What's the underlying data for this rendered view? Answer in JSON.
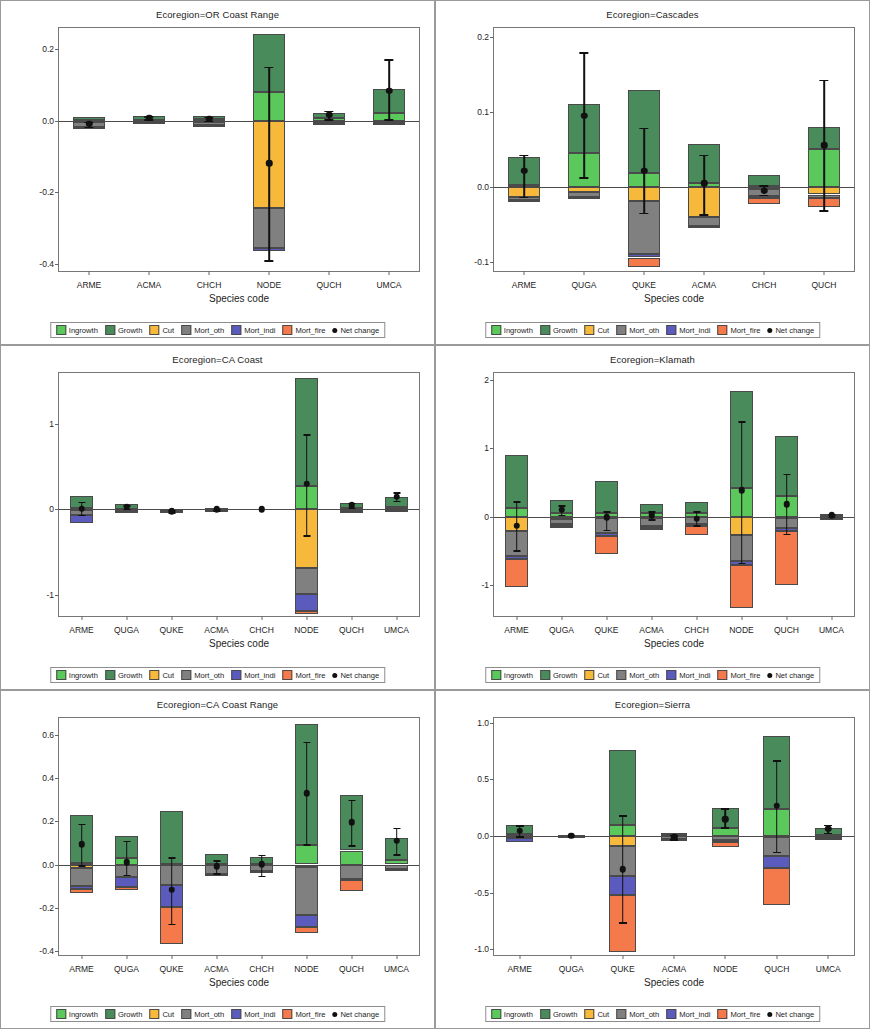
{
  "figure": {
    "xlabel": "Species code",
    "ylabel_prefix": "Basal area change (100,000 m",
    "ylabel_sup1": "2",
    "ylabel_mid": "yr",
    "ylabel_sup2": "-1",
    "ylabel_suffix": ")"
  },
  "legend": {
    "items": [
      {
        "label": "Ingrowth",
        "color": "#5ac85a"
      },
      {
        "label": "Growth",
        "color": "#4a8b5c"
      },
      {
        "label": "Cut",
        "color": "#f6b93b"
      },
      {
        "label": "Mort_oth",
        "color": "#808080"
      },
      {
        "label": "Mort_indi",
        "color": "#5b5bbd"
      },
      {
        "label": "Mort_fire",
        "color": "#f4794b"
      },
      {
        "label": "Net change",
        "color": "#111111"
      }
    ]
  },
  "colors": {
    "ingrowth": "#5ac85a",
    "growth": "#4a8b5c",
    "cut": "#f6b93b",
    "mort_oth": "#808080",
    "mort_indi": "#5b5bbd",
    "mort_fire": "#f4794b",
    "net_change": "#111111"
  },
  "chart_data": [
    {
      "type": "bar",
      "stacked": true,
      "panel_index": 0,
      "title": "Ecoregion=OR Coast Range",
      "xlabel": "Species code",
      "ylabel": "Basal area change (100,000 m2yr-1)",
      "ylim": [
        -0.42,
        0.26
      ],
      "yticks": [
        0.2,
        0.0,
        -0.2,
        -0.4
      ],
      "ytick_labels": [
        "0.2",
        "0.0",
        "-0.2",
        "-0.4"
      ],
      "categories": [
        "ARME",
        "ACMA",
        "CHCH",
        "NODE",
        "QUCH",
        "UMCA"
      ],
      "series": [
        {
          "name": "Ingrowth",
          "values": [
            0.002,
            0.003,
            0.004,
            0.082,
            0.008,
            0.021
          ]
        },
        {
          "name": "Growth",
          "values": [
            0.008,
            0.01,
            0.011,
            0.162,
            0.014,
            0.069
          ]
        },
        {
          "name": "Cut",
          "values": [
            -0.002,
            -0.001,
            -0.002,
            -0.245,
            -0.001,
            -0.002
          ]
        },
        {
          "name": "Mort_oth",
          "values": [
            -0.014,
            -0.003,
            -0.01,
            -0.11,
            -0.004,
            -0.003
          ]
        },
        {
          "name": "Mort_indi",
          "values": [
            -0.001,
            -0.001,
            -0.001,
            -0.008,
            -0.001,
            -0.001
          ]
        },
        {
          "name": "Mort_fire",
          "values": [
            0.0,
            0.0,
            0.0,
            0.0,
            0.0,
            0.0
          ]
        }
      ],
      "net_change": [
        -0.008,
        0.009,
        0.006,
        -0.118,
        0.017,
        0.085
      ],
      "error_low": [
        -0.016,
        0.004,
        0.001,
        -0.39,
        0.005,
        0.004
      ],
      "error_high": [
        -0.002,
        0.014,
        0.012,
        0.152,
        0.029,
        0.172
      ]
    },
    {
      "type": "bar",
      "stacked": true,
      "panel_index": 1,
      "title": "Ecoregion=Cascades",
      "xlabel": "Species code",
      "ylabel": "Basal area change (100,000 m2yr-1)",
      "ylim": [
        -0.112,
        0.212
      ],
      "yticks": [
        0.2,
        0.1,
        0.0,
        -0.1
      ],
      "ytick_labels": [
        "0.2",
        "0.1",
        "0.0",
        "-0.1"
      ],
      "categories": [
        "ARME",
        "QUGA",
        "QUKE",
        "ACMA",
        "CHCH",
        "QUCH"
      ],
      "series": [
        {
          "name": "Ingrowth",
          "values": [
            0.003,
            0.045,
            0.019,
            0.006,
            0.002,
            0.051
          ]
        },
        {
          "name": "Growth",
          "values": [
            0.037,
            0.066,
            0.11,
            0.052,
            0.014,
            0.029
          ]
        },
        {
          "name": "Cut",
          "values": [
            -0.013,
            -0.007,
            -0.019,
            -0.04,
            -0.002,
            -0.01
          ]
        },
        {
          "name": "Mort_oth",
          "values": [
            -0.004,
            -0.006,
            -0.07,
            -0.012,
            -0.01,
            -0.004
          ]
        },
        {
          "name": "Mort_indi",
          "values": [
            -0.001,
            -0.002,
            -0.005,
            -0.001,
            -0.003,
            -0.001
          ]
        },
        {
          "name": "Mort_fire",
          "values": [
            0.0,
            0.0,
            -0.012,
            0.0,
            -0.008,
            -0.011
          ]
        }
      ],
      "net_change": [
        0.022,
        0.095,
        0.022,
        0.005,
        -0.005,
        0.056
      ],
      "error_low": [
        -0.013,
        0.013,
        -0.034,
        -0.036,
        -0.01,
        -0.031
      ],
      "error_high": [
        0.043,
        0.18,
        0.079,
        0.043,
        0.002,
        0.143
      ]
    },
    {
      "type": "bar",
      "stacked": true,
      "panel_index": 2,
      "title": "Ecoregion=CA Coast",
      "xlabel": "Species code",
      "ylabel": "Basal area change (100,000 m2yr-1)",
      "ylim": [
        -1.25,
        1.6
      ],
      "yticks": [
        1,
        0,
        -1
      ],
      "ytick_labels": [
        "1",
        "0",
        "-1"
      ],
      "categories": [
        "ARME",
        "QUGA",
        "QUKE",
        "ACMA",
        "CHCH",
        "NODE",
        "QUCH",
        "UMCA"
      ],
      "series": [
        {
          "name": "Ingrowth",
          "values": [
            0.02,
            0.01,
            0.002,
            0.003,
            0.0,
            0.27,
            0.02,
            0.03
          ]
        },
        {
          "name": "Growth",
          "values": [
            0.14,
            0.05,
            0.004,
            0.008,
            0.0,
            1.27,
            0.05,
            0.11
          ]
        },
        {
          "name": "Cut",
          "values": [
            -0.01,
            -0.005,
            -0.002,
            -0.002,
            0.0,
            -0.69,
            -0.004,
            -0.003
          ]
        },
        {
          "name": "Mort_oth",
          "values": [
            -0.05,
            -0.01,
            -0.022,
            -0.01,
            0.0,
            -0.3,
            -0.01,
            -0.006
          ]
        },
        {
          "name": "Mort_indi",
          "values": [
            -0.1,
            -0.003,
            -0.003,
            -0.002,
            0.0,
            -0.2,
            -0.003,
            -0.002
          ]
        },
        {
          "name": "Mort_fire",
          "values": [
            0.0,
            0.0,
            0.0,
            0.0,
            0.0,
            -0.04,
            0.0,
            0.0
          ]
        }
      ],
      "net_change": [
        0.005,
        0.03,
        -0.02,
        0.0,
        0.0,
        0.3,
        0.05,
        0.15
      ],
      "error_low": [
        -0.06,
        0.01,
        -0.03,
        -0.01,
        0.0,
        -0.3,
        0.02,
        0.1
      ],
      "error_high": [
        0.09,
        0.05,
        -0.01,
        0.01,
        0.0,
        0.88,
        0.08,
        0.2
      ]
    },
    {
      "type": "bar",
      "stacked": true,
      "panel_index": 3,
      "title": "Ecoregion=Klamath",
      "xlabel": "Species code",
      "ylabel": "Basal area change (100,000 m2yr-1)",
      "ylim": [
        -1.45,
        2.1
      ],
      "yticks": [
        2,
        1,
        0,
        -1
      ],
      "ytick_labels": [
        "2",
        "1",
        "0",
        "-1"
      ],
      "categories": [
        "ARME",
        "QUGA",
        "QUKE",
        "ACMA",
        "CHCH",
        "NODE",
        "QUCH",
        "UMCA"
      ],
      "series": [
        {
          "name": "Ingrowth",
          "values": [
            0.13,
            0.05,
            0.05,
            0.05,
            0.06,
            0.42,
            0.3,
            0.01
          ]
        },
        {
          "name": "Growth",
          "values": [
            0.77,
            0.2,
            0.47,
            0.14,
            0.16,
            1.41,
            0.88,
            0.03
          ]
        },
        {
          "name": "Cut",
          "values": [
            -0.21,
            -0.03,
            -0.02,
            -0.02,
            -0.01,
            -0.27,
            -0.02,
            -0.005
          ]
        },
        {
          "name": "Mort_oth",
          "values": [
            -0.36,
            -0.08,
            -0.22,
            -0.12,
            -0.1,
            -0.38,
            -0.14,
            -0.01
          ]
        },
        {
          "name": "Mort_indi",
          "values": [
            -0.05,
            -0.02,
            -0.04,
            -0.02,
            -0.02,
            -0.05,
            -0.05,
            -0.003
          ]
        },
        {
          "name": "Mort_fire",
          "values": [
            -0.41,
            -0.03,
            -0.27,
            -0.03,
            -0.14,
            -0.63,
            -0.78,
            -0.002
          ]
        }
      ],
      "net_change": [
        -0.13,
        0.1,
        -0.01,
        0.02,
        -0.03,
        0.39,
        0.18,
        0.02
      ],
      "error_low": [
        -0.49,
        0.03,
        -0.19,
        -0.04,
        -0.12,
        -0.67,
        -0.25,
        0.0
      ],
      "error_high": [
        0.23,
        0.17,
        0.08,
        0.08,
        0.08,
        1.4,
        0.63,
        0.04
      ]
    },
    {
      "type": "bar",
      "stacked": true,
      "panel_index": 4,
      "title": "Ecoregion=CA Coast Range",
      "xlabel": "Species code",
      "ylabel": "Basal area change (100,000 m2yr-1)",
      "ylim": [
        -0.42,
        0.68
      ],
      "yticks": [
        0.6,
        0.4,
        0.2,
        0.0,
        -0.2,
        -0.4
      ],
      "ytick_labels": [
        "0.6",
        "0.4",
        "0.2",
        "0.0",
        "-0.2",
        "-0.4"
      ],
      "categories": [
        "ARME",
        "QUGA",
        "QUKE",
        "ACMA",
        "CHCH",
        "NODE",
        "QUCH",
        "UMCA"
      ],
      "series": [
        {
          "name": "Ingrowth",
          "values": [
            0.005,
            0.032,
            0.004,
            0.004,
            0.002,
            0.092,
            0.065,
            0.02
          ]
        },
        {
          "name": "Growth",
          "values": [
            0.223,
            0.099,
            0.246,
            0.044,
            0.032,
            0.56,
            0.258,
            0.102
          ]
        },
        {
          "name": "Cut",
          "values": [
            -0.014,
            -0.003,
            -0.002,
            -0.002,
            -0.001,
            -0.013,
            -0.003,
            -0.002
          ]
        },
        {
          "name": "Mort_oth",
          "values": [
            -0.084,
            -0.053,
            -0.094,
            -0.042,
            -0.03,
            -0.22,
            -0.064,
            -0.021
          ]
        },
        {
          "name": "Mort_indi",
          "values": [
            -0.014,
            -0.05,
            -0.103,
            -0.002,
            -0.001,
            -0.055,
            -0.005,
            -0.002
          ]
        },
        {
          "name": "Mort_fire",
          "values": [
            -0.021,
            -0.012,
            -0.168,
            0.0,
            0.0,
            -0.03,
            -0.052,
            0.0
          ]
        }
      ],
      "net_change": [
        0.094,
        0.01,
        -0.117,
        -0.008,
        0.001,
        0.33,
        0.195,
        0.11
      ],
      "error_low": [
        -0.004,
        -0.047,
        -0.275,
        -0.039,
        -0.052,
        0.095,
        0.09,
        0.047
      ],
      "error_high": [
        0.19,
        0.11,
        0.035,
        0.021,
        0.046,
        0.57,
        0.3,
        0.17
      ]
    },
    {
      "type": "bar",
      "stacked": true,
      "panel_index": 5,
      "title": "Ecoregion=Sierra",
      "xlabel": "Species code",
      "ylabel": "Basal area change (100,000 m2yr-1)",
      "ylim": [
        -1.05,
        1.04
      ],
      "yticks": [
        1.0,
        0.5,
        0.0,
        -0.5,
        -1.0
      ],
      "ytick_labels": [
        "1.0",
        "0.5",
        "0.0",
        "-0.5",
        "-1.0"
      ],
      "categories": [
        "ARME",
        "QUGA",
        "QUKE",
        "ACMA",
        "NODE",
        "QUCH",
        "UMCA"
      ],
      "series": [
        {
          "name": "Ingrowth",
          "values": [
            0.013,
            0.002,
            0.1,
            0.004,
            0.072,
            0.237,
            0.012
          ]
        },
        {
          "name": "Growth",
          "values": [
            0.083,
            0.004,
            0.66,
            0.02,
            0.173,
            0.648,
            0.06
          ]
        },
        {
          "name": "Cut",
          "values": [
            -0.004,
            -0.001,
            -0.087,
            -0.003,
            -0.004,
            -0.005,
            -0.002
          ]
        },
        {
          "name": "Mort_oth",
          "values": [
            -0.016,
            -0.003,
            -0.27,
            -0.026,
            -0.03,
            -0.168,
            -0.012
          ]
        },
        {
          "name": "Mort_indi",
          "values": [
            -0.03,
            -0.001,
            -0.165,
            -0.003,
            -0.02,
            -0.108,
            -0.003
          ]
        },
        {
          "name": "Mort_fire",
          "values": [
            0.0,
            0.0,
            -0.5,
            0.0,
            -0.048,
            -0.33,
            0.0
          ]
        }
      ],
      "net_change": [
        0.045,
        0.0,
        -0.295,
        -0.01,
        0.145,
        0.265,
        0.065
      ],
      "error_low": [
        0.0,
        0.0,
        -0.76,
        -0.03,
        0.075,
        -0.14,
        0.03
      ],
      "error_high": [
        0.095,
        0.0,
        0.185,
        0.01,
        0.245,
        0.67,
        0.1
      ]
    }
  ]
}
